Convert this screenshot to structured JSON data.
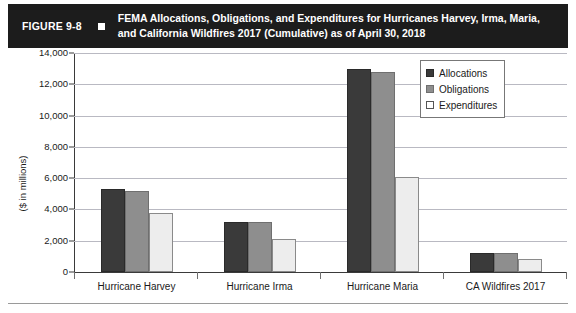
{
  "figure": {
    "label": "FIGURE 9-8",
    "bullet_icon": "square-bullet-icon",
    "title": "FEMA Allocations, Obligations, and Expenditures for Hurricanes Harvey, Irma, Maria, and California Wildfires 2017 (Cumulative) as of April 30, 2018"
  },
  "chart_data": {
    "type": "bar",
    "title": "FEMA Allocations, Obligations, and Expenditures for Hurricanes Harvey, Irma, Maria, and California Wildfires 2017 (Cumulative) as of April 30, 2018",
    "xlabel": "",
    "ylabel": "($ in millions)",
    "categories": [
      "Hurricane Harvey",
      "Hurricane Irma",
      "Hurricane Maria",
      "CA Wildfires 2017"
    ],
    "series": [
      {
        "name": "Allocations",
        "color": "#3a3a3a",
        "values": [
          5300,
          3200,
          13000,
          1200
        ]
      },
      {
        "name": "Obligations",
        "color": "#8e8e8e",
        "values": [
          5150,
          3200,
          12800,
          1200
        ]
      },
      {
        "name": "Expenditures",
        "color": "#ededed",
        "values": [
          3800,
          2100,
          6100,
          850
        ]
      }
    ],
    "ylim": [
      0,
      14000
    ],
    "yticks": [
      0,
      2000,
      4000,
      6000,
      8000,
      10000,
      12000,
      14000
    ],
    "ytick_labels": [
      "0",
      "2,000",
      "4,000",
      "6,000",
      "8,000",
      "10,000",
      "12,000",
      "14,000"
    ],
    "grid": true,
    "legend_position": "top-right"
  }
}
